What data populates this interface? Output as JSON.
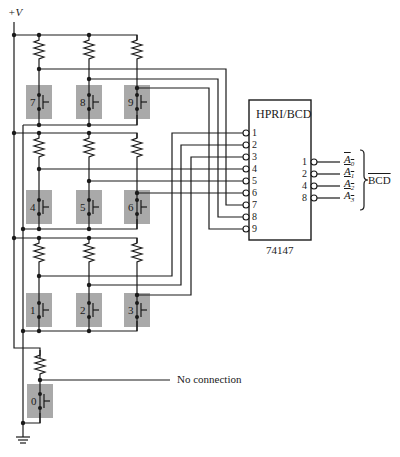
{
  "supply_label": "+V",
  "ic": {
    "title": "HPRI/BCD",
    "part_number": "74147",
    "inputs": [
      "1",
      "2",
      "3",
      "4",
      "5",
      "6",
      "7",
      "8",
      "9"
    ],
    "outputs": [
      {
        "weight": "1",
        "signal": "A0"
      },
      {
        "weight": "2",
        "signal": "A1"
      },
      {
        "weight": "4",
        "signal": "A2"
      },
      {
        "weight": "8",
        "signal": "A3"
      }
    ],
    "output_group_label": "BCD"
  },
  "switches": [
    {
      "digit": "7"
    },
    {
      "digit": "8"
    },
    {
      "digit": "9"
    },
    {
      "digit": "4"
    },
    {
      "digit": "5"
    },
    {
      "digit": "6"
    },
    {
      "digit": "1"
    },
    {
      "digit": "2"
    },
    {
      "digit": "3"
    },
    {
      "digit": "0"
    }
  ],
  "no_connection_label": "No connection",
  "colors": {
    "wire": "#1a1a1a",
    "switch_fill": "#a9a9a9",
    "background": "#ffffff"
  }
}
